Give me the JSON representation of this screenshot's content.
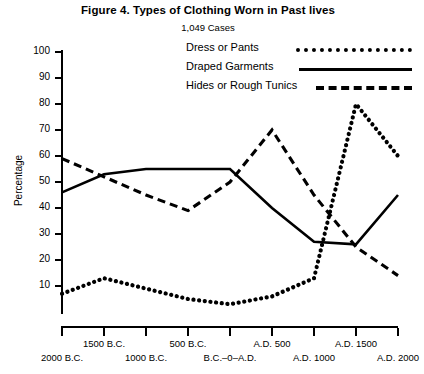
{
  "header": {
    "title": "Figure 4.  Types of Clothing Worn in Past lives",
    "subtitle": "1,049 Cases"
  },
  "legend": {
    "items": [
      {
        "label": "Dress or Pants",
        "style": "dotted"
      },
      {
        "label": "Draped Garments",
        "style": "solid"
      },
      {
        "label": "Hides or Rough Tunics",
        "style": "dashed"
      }
    ]
  },
  "axes": {
    "ylabel": "Percentage",
    "yticks": [
      "100",
      "90",
      "80",
      "70",
      "60",
      "50",
      "40",
      "30",
      "20",
      "10"
    ],
    "xticks_upper": [
      "1500 B.C.",
      "500 B.C.",
      "A.D. 500",
      "A.D. 1500"
    ],
    "xticks_lower": [
      "2000 B.C.",
      "1000 B.C.",
      "B.C.–0–A.D.",
      "A.D. 1000",
      "A.D. 2000"
    ]
  },
  "chart_data": {
    "type": "line",
    "title": "Figure 4.  Types of Clothing Worn in Past lives",
    "subtitle": "1,049 Cases",
    "xlabel": "",
    "ylabel": "Percentage",
    "ylim": [
      0,
      100
    ],
    "xlim": [
      -2000,
      2000
    ],
    "grid": false,
    "legend_position": "top-right",
    "x": [
      -2000,
      -1500,
      -1000,
      -500,
      0,
      500,
      1000,
      1500,
      2000
    ],
    "x_tick_labels": [
      "2000 B.C.",
      "1500 B.C.",
      "1000 B.C.",
      "500 B.C.",
      "B.C.–0–A.D.",
      "A.D. 500",
      "A.D. 1000",
      "A.D. 1500",
      "A.D. 2000"
    ],
    "series": [
      {
        "name": "Dress or Pants",
        "style": "dotted",
        "values": [
          7,
          13,
          9,
          5,
          3,
          6,
          13,
          80,
          60
        ]
      },
      {
        "name": "Draped Garments",
        "style": "solid",
        "values": [
          46,
          53,
          55,
          55,
          55,
          40,
          27,
          26,
          45
        ]
      },
      {
        "name": "Hides or Rough Tunics",
        "style": "dashed",
        "values": [
          59,
          52,
          45,
          39,
          50,
          70,
          45,
          25,
          14
        ]
      }
    ]
  }
}
